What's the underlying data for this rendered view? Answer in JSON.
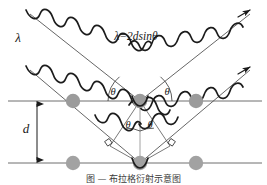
{
  "figure": {
    "type": "bragg-diffraction-diagram",
    "background_color": "#ffffff",
    "width": 267,
    "height": 185,
    "labels": {
      "wavelength": "λ",
      "equation": "λ=2dsinθ",
      "spacing": "d",
      "theta_upper_left": "θ",
      "theta_upper_right": "θ",
      "theta_lower_left": "θ",
      "theta_lower_right": "θ"
    },
    "caption": "图  —  布拉格衍射示意图",
    "colors": {
      "atom_fill": "#9b9b9b",
      "atom_fill_light": "#a9a9a9",
      "lattice_line": "#6e6e6e",
      "wave_stroke": "#222222",
      "ray_stroke": "#555555",
      "dimension_stroke": "#1a1a1a",
      "text": "#1a1a1a"
    },
    "geometry": {
      "plane_top_y": 101,
      "plane_bottom_y": 163,
      "scatter_point_upper": [
        140,
        101
      ],
      "scatter_point_lower": [
        140,
        163
      ],
      "atom_radius": 7,
      "atoms_top_row_x": [
        73,
        140,
        196
      ],
      "atoms_bottom_row_x": [
        73,
        140,
        196
      ],
      "d_arrow_x": 37
    }
  }
}
